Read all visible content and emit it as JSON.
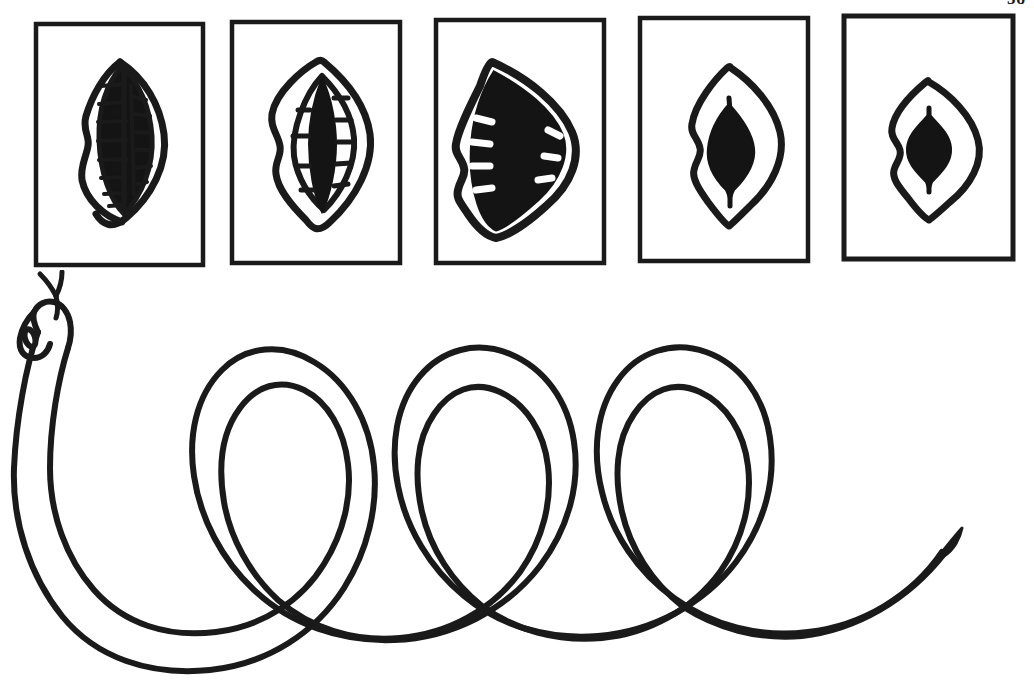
{
  "page": {
    "number": "58",
    "background_color": "#ffffff",
    "ink_color": "#1a1a1a"
  },
  "figure": {
    "title": "Snake gape sequence and coiled serpent"
  },
  "panels": [
    {
      "id": "panel-1",
      "label": "Stage 1 — wide lateral gape with full tooth rows",
      "gape_state": "wide-open-lateral",
      "teeth_visible": true,
      "teeth_count_left": 9,
      "teeth_count_right": 8,
      "interior_fill": "#141414",
      "frame": {
        "x": 36,
        "y": 24,
        "width": 167,
        "height": 241
      }
    },
    {
      "id": "panel-2",
      "label": "Stage 2 — narrowed gape, teeth reduced",
      "gape_state": "narrowed",
      "teeth_visible": true,
      "teeth_count_left": 5,
      "teeth_count_right": 6,
      "interior_fill": "#141414",
      "frame": {
        "x": 232,
        "y": 22,
        "width": 168,
        "height": 241
      }
    },
    {
      "id": "panel-3",
      "label": "Stage 3 — maximal gape, interior fully dark",
      "gape_state": "maximal",
      "teeth_visible": true,
      "teeth_count_left": 4,
      "teeth_count_right": 3,
      "interior_fill": "#141414",
      "frame": {
        "x": 436,
        "y": 20,
        "width": 168,
        "height": 243
      }
    },
    {
      "id": "panel-4",
      "label": "Stage 4 — nearly closed, narrow dark slit",
      "gape_state": "nearly-closed",
      "teeth_visible": false,
      "teeth_count_left": 0,
      "teeth_count_right": 0,
      "interior_fill": "#141414",
      "frame": {
        "x": 640,
        "y": 18,
        "width": 168,
        "height": 243
      }
    },
    {
      "id": "panel-5",
      "label": "Stage 5 — closed, minimal dark aperture",
      "gape_state": "closed",
      "teeth_visible": false,
      "teeth_count_left": 0,
      "teeth_count_right": 0,
      "interior_fill": "#141414",
      "frame": {
        "x": 844,
        "y": 16,
        "width": 169,
        "height": 243
      }
    }
  ],
  "snake": {
    "label": "Coiled snake with extended forked tongue",
    "head_position": "upper-left",
    "tongue": "forked",
    "eye_visible": true,
    "coil_count": 4,
    "body_style": "double-outline ribbon",
    "tail_position": "lower-right",
    "stroke_color": "#1a1a1a"
  }
}
